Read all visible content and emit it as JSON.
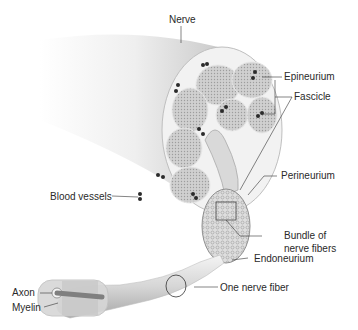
{
  "diagram": {
    "labels": {
      "nerve": "Nerve",
      "epineurium": "Epineurium",
      "fascicle": "Fascicle",
      "blood_vessels": "Blood vessels",
      "perineurium": "Perineurium",
      "bundle_line1": "Bundle of",
      "bundle_line2": "nerve fibers",
      "endoneurium": "Endoneurium",
      "one_nerve_fiber": "One nerve fiber",
      "axon": "Axon",
      "myelin": "Myelin"
    },
    "colors": {
      "background": "#ffffff",
      "tissue": "#d4d4d4",
      "tissue_dark": "#9a9a9a",
      "fascicle_fill": "#c8c8c8",
      "vessel": "#2b2b2b",
      "leader": "#333333",
      "text": "#2a2a2a"
    }
  }
}
